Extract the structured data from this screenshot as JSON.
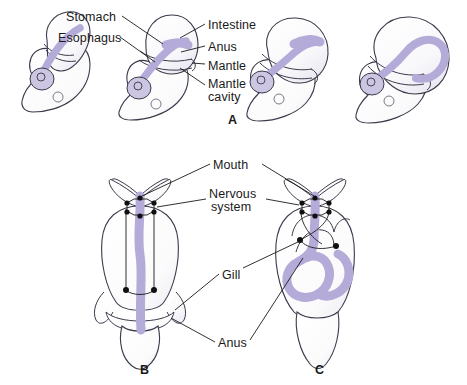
{
  "figure": {
    "background_color": "#ffffff",
    "gut_color": "#b5abd8",
    "outline_color": "#3a3a4a",
    "leader_color": "#1a1a1a",
    "ganglion_color": "#101010",
    "text_color": "#1a1a1a"
  },
  "panels": [
    {
      "letter": "A",
      "caption_x": 228,
      "caption_y": 113,
      "description": "Lateral views of larval torsion sequence, four stages"
    },
    {
      "letter": "B",
      "caption_x": 140,
      "caption_y": 363,
      "description": "Dorsal view, pretorsion, untwisted gut and nerve cords"
    },
    {
      "letter": "C",
      "caption_x": 315,
      "caption_y": 363,
      "description": "Dorsal view, posttorsion, looped gut and crossed nerve cords"
    }
  ],
  "labels_panel_a": [
    {
      "id": "stomach",
      "text": "Stomach",
      "x": 66,
      "y": 11,
      "align": "left"
    },
    {
      "id": "esophagus",
      "text": "Esophagus",
      "x": 58,
      "y": 32,
      "align": "left"
    },
    {
      "id": "intestine",
      "text": "Intestine",
      "x": 208,
      "y": 19,
      "align": "left"
    },
    {
      "id": "anus",
      "text": "Anus",
      "x": 208,
      "y": 41,
      "align": "left"
    },
    {
      "id": "mantle",
      "text": "Mantle",
      "x": 208,
      "y": 60,
      "align": "left"
    },
    {
      "id": "mantle-cavity-line1",
      "text": "Mantle",
      "x": 208,
      "y": 78,
      "align": "left"
    },
    {
      "id": "mantle-cavity-line2",
      "text": "cavity",
      "x": 208,
      "y": 91,
      "align": "left"
    }
  ],
  "labels_panel_bc": [
    {
      "id": "mouth",
      "text": "Mouth",
      "x": 213,
      "y": 159,
      "align": "left"
    },
    {
      "id": "nervous-system-line1",
      "text": "Nervous",
      "x": 209,
      "y": 188,
      "align": "left"
    },
    {
      "id": "nervous-system-line2",
      "text": "system",
      "x": 211,
      "y": 201,
      "align": "left"
    },
    {
      "id": "gill",
      "text": "Gill",
      "x": 222,
      "y": 269,
      "align": "left"
    },
    {
      "id": "anus-bc",
      "text": "Anus",
      "x": 218,
      "y": 337,
      "align": "left"
    }
  ]
}
